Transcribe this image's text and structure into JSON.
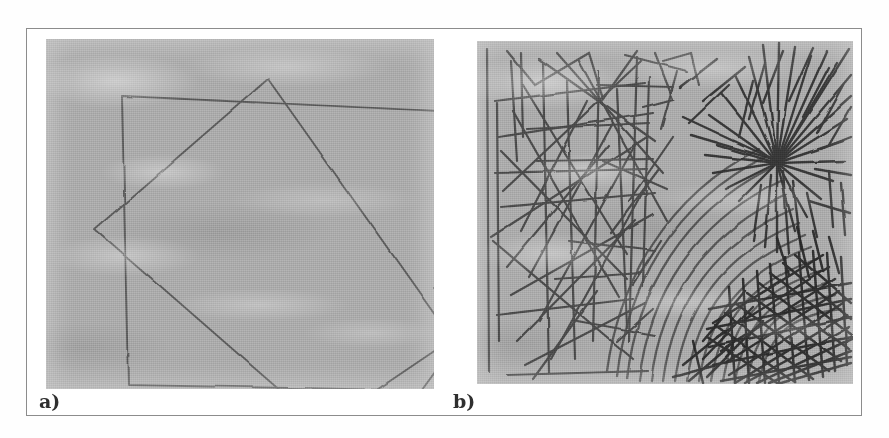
{
  "figure": {
    "caption_labels": [
      "a)",
      "b)"
    ],
    "background_color": "#ffffff",
    "frame_color": "#8c8c8c",
    "paper_color": "#a9a9a9",
    "ink_color": "#4a4a4a",
    "ink_color_dark": "#2f2f2f"
  },
  "panels": [
    {
      "id": "a",
      "label": "a)",
      "description": "Two overlapping hand-drawn quadrilaterals on textured gray paper: one near axis-aligned square and one rotated diamond-like square",
      "shapes": [
        {
          "name": "axis-aligned-square",
          "points": "76,57 413,73 408,352 82,346"
        },
        {
          "name": "rotated-square",
          "points": "222,40 406,300 276,388 49,190"
        },
        {
          "name": "stray-line-right",
          "points": "413,300 357,377"
        }
      ]
    },
    {
      "id": "b",
      "label": "b)",
      "description": "Dense hand-drawn texture study on gray paper: straight zigzag line network on the left, concentric curved arcs through the middle, spiky starburst scribble at top right and heavy dense cross-hatched scribble at bottom right",
      "regions": [
        {
          "name": "zigzag-line-network",
          "area": "left"
        },
        {
          "name": "concentric-arcs",
          "area": "center-right"
        },
        {
          "name": "spiky-starburst",
          "area": "top-right"
        },
        {
          "name": "dense-crosshatch-scribble",
          "area": "bottom-right"
        }
      ]
    }
  ]
}
